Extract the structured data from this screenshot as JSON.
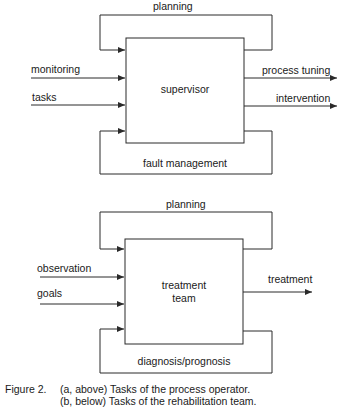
{
  "diagrams": [
    {
      "id": "a",
      "box_label_lines": [
        "supervisor"
      ],
      "loop_top_label": "planning",
      "loop_bottom_label": "fault management",
      "inputs": [
        "monitoring",
        "tasks"
      ],
      "outputs": [
        "process tuning",
        "intervention"
      ]
    },
    {
      "id": "b",
      "box_label_lines": [
        "treatment",
        "team"
      ],
      "loop_top_label": "planning",
      "loop_bottom_label": "diagnosis/prognosis",
      "inputs": [
        "observation",
        "goals"
      ],
      "outputs": [
        "treatment"
      ]
    }
  ],
  "caption": {
    "number": "Figure 2.",
    "line1": "(a, above) Tasks of the process operator.",
    "line2": "(b, below)  Tasks of the  rehabilitation team."
  },
  "colors": {
    "line": "#2a2a2a",
    "text": "#1a1a1a",
    "background": "#ffffff"
  }
}
